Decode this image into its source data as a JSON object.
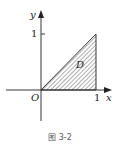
{
  "figure": {
    "caption": "图 3-2",
    "axes": {
      "x_label": "x",
      "y_label": "y",
      "origin_label": "O"
    },
    "ticks": {
      "x_one": "1",
      "y_one": "1"
    },
    "region": {
      "label": "D",
      "description": "Triangle with vertices (0,0), (1,0), (1,1), hatched"
    }
  }
}
